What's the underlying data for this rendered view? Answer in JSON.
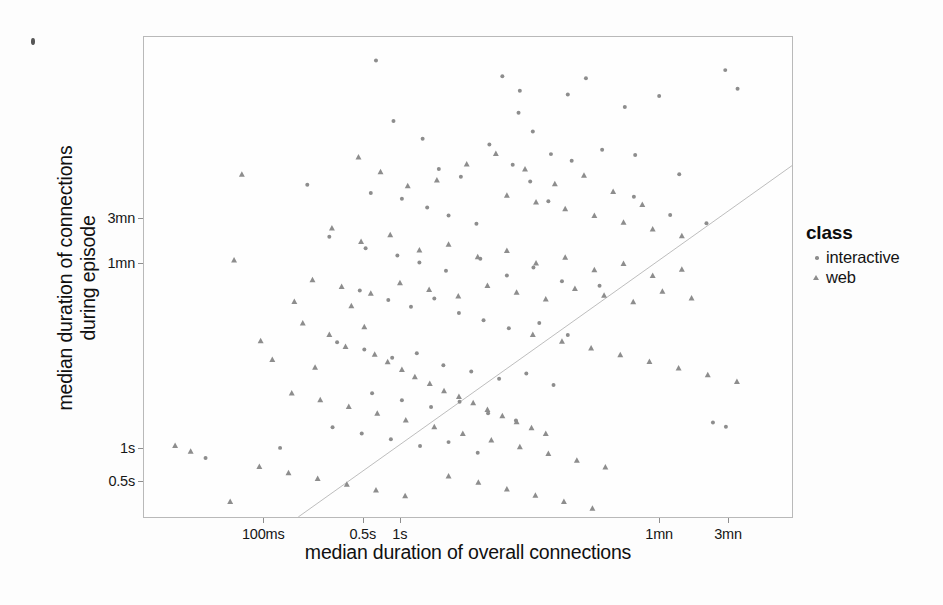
{
  "chart_data": {
    "type": "scatter",
    "title": "",
    "xlabel": "median duration of overall connections",
    "ylabel_line1": "median duration of connections",
    "ylabel_line2": "during episode",
    "xscale": "log",
    "yscale": "log",
    "grid": false,
    "legend": {
      "title": "class",
      "position": "right",
      "entries": [
        {
          "label": "interactive",
          "marker": "circle",
          "color": "#8d8d8d"
        },
        {
          "label": "web",
          "marker": "triangle",
          "color": "#8d8d8d"
        }
      ]
    },
    "xticks": [
      {
        "label": "100ms",
        "pos": 0.185
      },
      {
        "label": "0.5s",
        "pos": 0.338
      },
      {
        "label": "1s",
        "pos": 0.395
      },
      {
        "label": "1mn",
        "pos": 0.794
      },
      {
        "label": "3mn",
        "pos": 0.9
      }
    ],
    "yticks": [
      {
        "label": "3mn",
        "pos": 0.377
      },
      {
        "label": "1mn",
        "pos": 0.471
      },
      {
        "label": "1s",
        "pos": 0.855
      },
      {
        "label": "0.5s",
        "pos": 0.923
      }
    ],
    "reference_line": {
      "description": "y = x diagonal identity line",
      "x0": 0.238,
      "y0": 1.0,
      "x1": 1.0,
      "y1": 0.268,
      "color": "#bdbdbd"
    },
    "series": [
      {
        "name": "interactive",
        "marker": "circle",
        "color": "#8d8d8d",
        "points": [
          [
            0.358,
            0.049
          ],
          [
            0.553,
            0.082
          ],
          [
            0.682,
            0.086
          ],
          [
            0.897,
            0.069
          ],
          [
            0.58,
            0.112
          ],
          [
            0.654,
            0.12
          ],
          [
            0.385,
            0.175
          ],
          [
            0.43,
            0.212
          ],
          [
            0.578,
            0.158
          ],
          [
            0.6,
            0.197
          ],
          [
            0.742,
            0.146
          ],
          [
            0.795,
            0.123
          ],
          [
            0.628,
            0.244
          ],
          [
            0.707,
            0.235
          ],
          [
            0.66,
            0.258
          ],
          [
            0.455,
            0.275
          ],
          [
            0.489,
            0.291
          ],
          [
            0.533,
            0.224
          ],
          [
            0.569,
            0.266
          ],
          [
            0.596,
            0.301
          ],
          [
            0.252,
            0.308
          ],
          [
            0.35,
            0.325
          ],
          [
            0.398,
            0.337
          ],
          [
            0.286,
            0.416
          ],
          [
            0.342,
            0.44
          ],
          [
            0.437,
            0.355
          ],
          [
            0.47,
            0.372
          ],
          [
            0.513,
            0.389
          ],
          [
            0.624,
            0.342
          ],
          [
            0.756,
            0.333
          ],
          [
            0.812,
            0.371
          ],
          [
            0.868,
            0.388
          ],
          [
            0.391,
            0.455
          ],
          [
            0.425,
            0.47
          ],
          [
            0.466,
            0.487
          ],
          [
            0.519,
            0.462
          ],
          [
            0.56,
            0.497
          ],
          [
            0.601,
            0.48
          ],
          [
            0.645,
            0.509
          ],
          [
            0.703,
            0.518
          ],
          [
            0.333,
            0.528
          ],
          [
            0.377,
            0.548
          ],
          [
            0.412,
            0.562
          ],
          [
            0.448,
            0.545
          ],
          [
            0.486,
            0.575
          ],
          [
            0.524,
            0.59
          ],
          [
            0.563,
            0.607
          ],
          [
            0.61,
            0.596
          ],
          [
            0.654,
            0.621
          ],
          [
            0.298,
            0.636
          ],
          [
            0.34,
            0.651
          ],
          [
            0.383,
            0.668
          ],
          [
            0.421,
            0.659
          ],
          [
            0.462,
            0.684
          ],
          [
            0.505,
            0.697
          ],
          [
            0.548,
            0.712
          ],
          [
            0.59,
            0.701
          ],
          [
            0.632,
            0.725
          ],
          [
            0.352,
            0.742
          ],
          [
            0.398,
            0.757
          ],
          [
            0.443,
            0.771
          ],
          [
            0.487,
            0.76
          ],
          [
            0.531,
            0.784
          ],
          [
            0.574,
            0.799
          ],
          [
            0.291,
            0.813
          ],
          [
            0.336,
            0.826
          ],
          [
            0.381,
            0.838
          ],
          [
            0.426,
            0.852
          ],
          [
            0.47,
            0.844
          ],
          [
            0.515,
            0.866
          ],
          [
            0.095,
            0.877
          ],
          [
            0.21,
            0.856
          ],
          [
            0.878,
            0.803
          ],
          [
            0.898,
            0.812
          ],
          [
            0.758,
            0.246
          ],
          [
            0.826,
            0.286
          ],
          [
            0.916,
            0.108
          ]
        ]
      },
      {
        "name": "web",
        "marker": "triangle",
        "color": "#8d8d8d",
        "points": [
          [
            0.151,
            0.286
          ],
          [
            0.139,
            0.465
          ],
          [
            0.232,
            0.551
          ],
          [
            0.245,
            0.596
          ],
          [
            0.18,
            0.633
          ],
          [
            0.198,
            0.672
          ],
          [
            0.264,
            0.688
          ],
          [
            0.32,
            0.56
          ],
          [
            0.34,
            0.604
          ],
          [
            0.286,
            0.62
          ],
          [
            0.311,
            0.645
          ],
          [
            0.356,
            0.661
          ],
          [
            0.376,
            0.677
          ],
          [
            0.398,
            0.693
          ],
          [
            0.418,
            0.708
          ],
          [
            0.441,
            0.722
          ],
          [
            0.463,
            0.737
          ],
          [
            0.486,
            0.749
          ],
          [
            0.508,
            0.762
          ],
          [
            0.53,
            0.776
          ],
          [
            0.553,
            0.789
          ],
          [
            0.575,
            0.802
          ],
          [
            0.598,
            0.814
          ],
          [
            0.62,
            0.826
          ],
          [
            0.331,
            0.25
          ],
          [
            0.365,
            0.281
          ],
          [
            0.407,
            0.31
          ],
          [
            0.452,
            0.298
          ],
          [
            0.498,
            0.265
          ],
          [
            0.543,
            0.243
          ],
          [
            0.588,
            0.275
          ],
          [
            0.634,
            0.306
          ],
          [
            0.679,
            0.288
          ],
          [
            0.724,
            0.322
          ],
          [
            0.769,
            0.349
          ],
          [
            0.29,
            0.398
          ],
          [
            0.335,
            0.426
          ],
          [
            0.38,
            0.412
          ],
          [
            0.425,
            0.444
          ],
          [
            0.47,
            0.432
          ],
          [
            0.515,
            0.458
          ],
          [
            0.56,
            0.445
          ],
          [
            0.605,
            0.471
          ],
          [
            0.65,
            0.459
          ],
          [
            0.695,
            0.485
          ],
          [
            0.74,
            0.472
          ],
          [
            0.785,
            0.497
          ],
          [
            0.83,
            0.484
          ],
          [
            0.26,
            0.506
          ],
          [
            0.305,
            0.52
          ],
          [
            0.35,
            0.534
          ],
          [
            0.395,
            0.512
          ],
          [
            0.44,
            0.526
          ],
          [
            0.485,
            0.54
          ],
          [
            0.53,
            0.518
          ],
          [
            0.575,
            0.532
          ],
          [
            0.62,
            0.546
          ],
          [
            0.665,
            0.524
          ],
          [
            0.71,
            0.538
          ],
          [
            0.755,
            0.552
          ],
          [
            0.8,
            0.53
          ],
          [
            0.845,
            0.544
          ],
          [
            0.228,
            0.742
          ],
          [
            0.272,
            0.756
          ],
          [
            0.316,
            0.77
          ],
          [
            0.36,
            0.784
          ],
          [
            0.404,
            0.798
          ],
          [
            0.448,
            0.812
          ],
          [
            0.492,
            0.826
          ],
          [
            0.536,
            0.84
          ],
          [
            0.58,
            0.854
          ],
          [
            0.624,
            0.868
          ],
          [
            0.668,
            0.882
          ],
          [
            0.712,
            0.896
          ],
          [
            0.47,
            0.915
          ],
          [
            0.516,
            0.928
          ],
          [
            0.56,
            0.942
          ],
          [
            0.604,
            0.955
          ],
          [
            0.648,
            0.968
          ],
          [
            0.692,
            0.982
          ],
          [
            0.048,
            0.851
          ],
          [
            0.072,
            0.863
          ],
          [
            0.178,
            0.895
          ],
          [
            0.223,
            0.908
          ],
          [
            0.268,
            0.92
          ],
          [
            0.313,
            0.932
          ],
          [
            0.358,
            0.944
          ],
          [
            0.403,
            0.956
          ],
          [
            0.133,
            0.968
          ],
          [
            0.6,
            0.62
          ],
          [
            0.645,
            0.634
          ],
          [
            0.69,
            0.648
          ],
          [
            0.735,
            0.662
          ],
          [
            0.78,
            0.676
          ],
          [
            0.825,
            0.69
          ],
          [
            0.87,
            0.704
          ],
          [
            0.915,
            0.718
          ],
          [
            0.56,
            0.33
          ],
          [
            0.605,
            0.344
          ],
          [
            0.65,
            0.358
          ],
          [
            0.695,
            0.372
          ],
          [
            0.74,
            0.386
          ],
          [
            0.785,
            0.4
          ],
          [
            0.83,
            0.414
          ]
        ]
      }
    ]
  }
}
